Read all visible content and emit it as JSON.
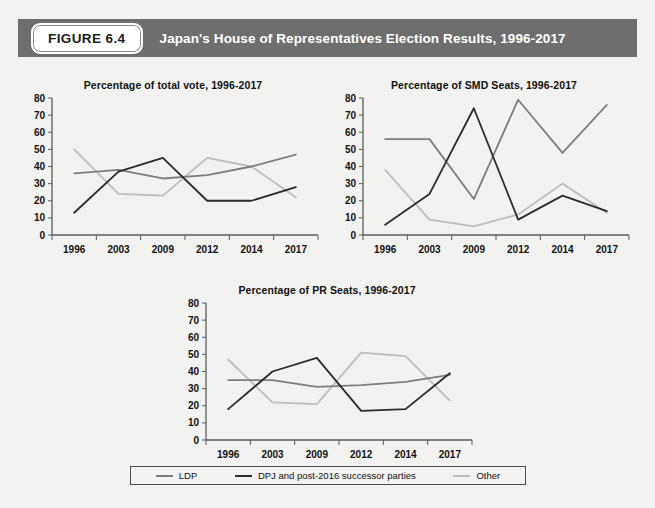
{
  "header": {
    "badge_label": "FIGURE 6.4",
    "title": "Japan's House of Representatives Election Results, 1996-2017",
    "bar_color": "#6e6e6e",
    "badge_bg": "#ffffff",
    "title_color": "#ffffff"
  },
  "page": {
    "background": "#f2f2f0"
  },
  "series_colors": {
    "ldp": "#7d7d7d",
    "dpj": "#2b2b2b",
    "other": "#bdbdbd"
  },
  "legend": {
    "items": [
      {
        "label": "LDP",
        "color": "#7d7d7d"
      },
      {
        "label": "DPJ and post-2016 successor parties",
        "color": "#2b2b2b"
      },
      {
        "label": "Other",
        "color": "#bdbdbd"
      }
    ]
  },
  "chart_data": [
    {
      "id": "total-vote",
      "type": "line",
      "title": "Percentage of total vote, 1996-2017",
      "xlabel": "",
      "ylabel": "",
      "categories": [
        "1996",
        "2003",
        "2009",
        "2012",
        "2014",
        "2017"
      ],
      "yticks": [
        0,
        10,
        20,
        30,
        40,
        50,
        60,
        70,
        80
      ],
      "ylim": [
        0,
        80
      ],
      "grid": false,
      "legend_position": "bottom-shared",
      "series": [
        {
          "name": "LDP",
          "color": "#7d7d7d",
          "values": [
            36,
            38,
            33,
            35,
            40,
            47
          ]
        },
        {
          "name": "DPJ and post-2016 successor parties",
          "color": "#2b2b2b",
          "values": [
            13,
            37,
            45,
            20,
            20,
            28
          ]
        },
        {
          "name": "Other",
          "color": "#bdbdbd",
          "values": [
            50,
            24,
            23,
            45,
            40,
            22
          ]
        }
      ]
    },
    {
      "id": "smd-seats",
      "type": "line",
      "title": "Percentage of SMD Seats, 1996-2017",
      "xlabel": "",
      "ylabel": "",
      "categories": [
        "1996",
        "2003",
        "2009",
        "2012",
        "2014",
        "2017"
      ],
      "yticks": [
        0,
        10,
        20,
        30,
        40,
        50,
        60,
        70,
        80
      ],
      "ylim": [
        0,
        80
      ],
      "grid": false,
      "legend_position": "bottom-shared",
      "series": [
        {
          "name": "LDP",
          "color": "#7d7d7d",
          "values": [
            56,
            56,
            21,
            79,
            48,
            76
          ]
        },
        {
          "name": "DPJ and post-2016 successor parties",
          "color": "#2b2b2b",
          "values": [
            6,
            24,
            74,
            9,
            23,
            14
          ]
        },
        {
          "name": "Other",
          "color": "#bdbdbd",
          "values": [
            38,
            9,
            5,
            12,
            30,
            13
          ]
        }
      ]
    },
    {
      "id": "pr-seats",
      "type": "line",
      "title": "Percentage of PR Seats, 1996-2017",
      "xlabel": "",
      "ylabel": "",
      "categories": [
        "1996",
        "2003",
        "2009",
        "2012",
        "2014",
        "2017"
      ],
      "yticks": [
        0,
        10,
        20,
        30,
        40,
        50,
        60,
        70,
        80
      ],
      "ylim": [
        0,
        80
      ],
      "grid": false,
      "legend_position": "bottom-shared",
      "series": [
        {
          "name": "LDP",
          "color": "#7d7d7d",
          "values": [
            35,
            35,
            31,
            32,
            34,
            38
          ]
        },
        {
          "name": "DPJ and post-2016 successor parties",
          "color": "#2b2b2b",
          "values": [
            18,
            40,
            48,
            17,
            18,
            39
          ]
        },
        {
          "name": "Other",
          "color": "#bdbdbd",
          "values": [
            47,
            22,
            21,
            51,
            49,
            23
          ]
        }
      ]
    }
  ]
}
